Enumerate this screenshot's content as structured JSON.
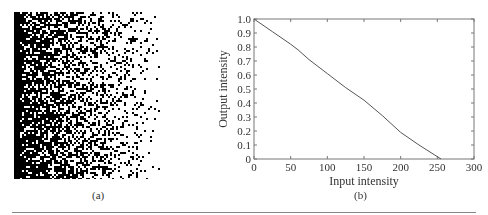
{
  "panels": {
    "a": {
      "caption": "(a)",
      "description": "dithered gradient: dense black on left fading to sparse dots on right"
    },
    "b": {
      "caption": "(b)"
    }
  },
  "chart_data": {
    "type": "line",
    "title": "",
    "xlabel": "Input intensity",
    "ylabel": "Output intensity",
    "xlim": [
      0,
      300
    ],
    "ylim": [
      0,
      1.0
    ],
    "xticks": [
      0,
      50,
      100,
      150,
      200,
      250,
      300
    ],
    "yticks": [
      0,
      0.1,
      0.2,
      0.3,
      0.4,
      0.5,
      0.6,
      0.7,
      0.8,
      0.9,
      1.0
    ],
    "ytick_labels": [
      "0",
      "0.1",
      "0.2",
      "0.3",
      "0.4",
      "0.5",
      "0.6",
      "0.7",
      "0.8",
      "0.9",
      "1.0"
    ],
    "grid": false,
    "series": [
      {
        "name": "mapping",
        "x": [
          0,
          25,
          50,
          60,
          75,
          100,
          125,
          150,
          175,
          200,
          225,
          255
        ],
        "y": [
          1.0,
          0.91,
          0.82,
          0.78,
          0.71,
          0.61,
          0.51,
          0.42,
          0.31,
          0.19,
          0.1,
          0.0
        ]
      }
    ]
  }
}
